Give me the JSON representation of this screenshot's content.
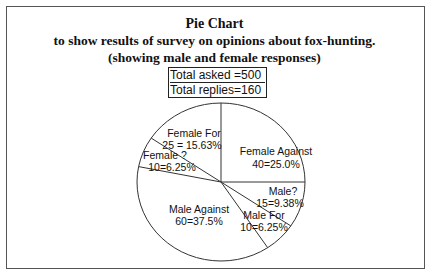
{
  "chart_data": {
    "type": "pie",
    "title": "Pie Chart",
    "subtitle": "to show results of survey on opinions about fox-hunting.",
    "subtitle2": "(showing male and female responses)",
    "annotations": [
      "Total asked =500",
      "Total replies=160"
    ],
    "start_angle": "12 o'clock, clockwise",
    "slices": [
      {
        "label": "Female Against",
        "value": 40,
        "percent": "25.0%",
        "text": "40=25.0%"
      },
      {
        "label": "Male?",
        "value": 15,
        "percent": "9.38%",
        "text": "15=9.38%"
      },
      {
        "label": "Male For",
        "value": 10,
        "percent": "6.25%",
        "text": "10=6.25%"
      },
      {
        "label": "Male Against",
        "value": 60,
        "percent": "37.5%",
        "text": "60=37.5%"
      },
      {
        "label": "Female ?",
        "value": 10,
        "percent": "6.25%",
        "text": "10=6.25%"
      },
      {
        "label": "Female For",
        "value": 25,
        "percent": "15.63%",
        "text": "25 = 15.63%"
      }
    ],
    "total": 160,
    "legend": "none (labels inside slices)"
  },
  "title": {
    "line1": "Pie Chart",
    "line2": "to show results of survey on opinions about fox-hunting.",
    "line3": "(showing male and female responses)"
  },
  "totals": {
    "asked": "Total asked =500",
    "replies": "Total replies=160"
  },
  "labels": {
    "female_against": {
      "name": "Female Against",
      "value": "40=25.0%"
    },
    "male_q": {
      "name": "Male?",
      "value": "15=9.38%"
    },
    "male_for": {
      "name": "Male For",
      "value": "10=6.25%"
    },
    "male_against": {
      "name": "Male Against",
      "value": "60=37.5%"
    },
    "female_q": {
      "name": "Female ?",
      "value": "10=6.25%"
    },
    "female_for": {
      "name": "Female For",
      "value": "25 = 15.63%"
    }
  }
}
